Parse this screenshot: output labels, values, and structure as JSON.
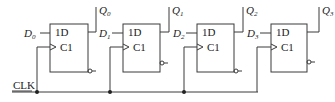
{
  "diagram": {
    "type": "shift-register",
    "clock_label": "CLK",
    "stages": [
      {
        "input": "D",
        "input_sub": "0",
        "output": "Q",
        "output_sub": "0",
        "d_pin": "1D",
        "c_pin": "C1"
      },
      {
        "input": "D",
        "input_sub": "1",
        "output": "Q",
        "output_sub": "1",
        "d_pin": "1D",
        "c_pin": "C1"
      },
      {
        "input": "D",
        "input_sub": "2",
        "output": "Q",
        "output_sub": "2",
        "d_pin": "1D",
        "c_pin": "C1"
      },
      {
        "input": "D",
        "input_sub": "3",
        "output": "Q",
        "output_sub": "3",
        "d_pin": "1D",
        "c_pin": "C1"
      }
    ],
    "colors": {
      "line": "#3a3a3a",
      "text": "#222222",
      "background": "#ffffff"
    }
  }
}
